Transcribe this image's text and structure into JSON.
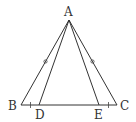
{
  "figure": {
    "type": "isosceles-triangle-diagram",
    "points": {
      "A": {
        "label": "A",
        "x": 69,
        "y": 20
      },
      "B": {
        "label": "B",
        "x": 21,
        "y": 105
      },
      "C": {
        "label": "C",
        "x": 117,
        "y": 105
      },
      "D": {
        "label": "D",
        "x": 39,
        "y": 105
      },
      "E": {
        "label": "E",
        "x": 99,
        "y": 105
      }
    },
    "segments": [
      "AB",
      "AC",
      "BC",
      "AD",
      "AE"
    ],
    "equal_marks": {
      "circle": [
        "AB",
        "AC"
      ],
      "tick": [
        "BD",
        "EC"
      ]
    },
    "colors": {
      "stroke": "#333333",
      "background": "#ffffff"
    }
  }
}
